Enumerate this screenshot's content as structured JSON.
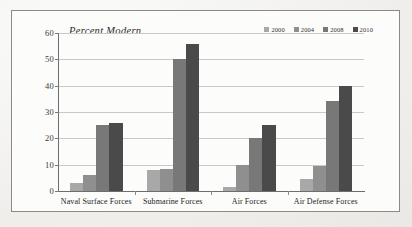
{
  "chart_data": {
    "type": "bar",
    "title": "Percent Modern",
    "xlabel": "",
    "ylabel": "",
    "ylim": [
      0,
      60
    ],
    "yticks": [
      0,
      10,
      20,
      30,
      40,
      50,
      60
    ],
    "grid": true,
    "legend_position": "top-right",
    "categories": [
      "Naval Surface Forces",
      "Submarine Forces",
      "Air Forces",
      "Air Defense Forces"
    ],
    "series": [
      {
        "name": "2000",
        "color": "#a8a8a8",
        "values": [
          3,
          8,
          1.5,
          4.5
        ]
      },
      {
        "name": "2004",
        "color": "#8f8f8f",
        "values": [
          6,
          8.5,
          10,
          9.5
        ]
      },
      {
        "name": "2008",
        "color": "#787878",
        "values": [
          25,
          50,
          20,
          34
        ]
      },
      {
        "name": "2010",
        "color": "#4a4a4a",
        "values": [
          26,
          56,
          25,
          40
        ]
      }
    ]
  },
  "axis": {
    "tick_labels": [
      "60",
      "50",
      "40",
      "30",
      "20",
      "10",
      "0"
    ]
  }
}
